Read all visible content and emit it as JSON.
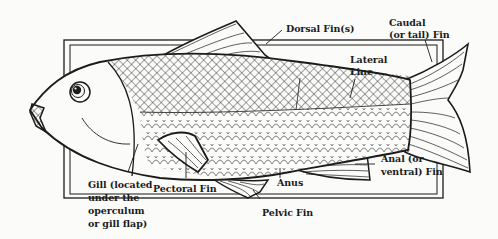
{
  "figure": {
    "type": "labeled anatomical diagram",
    "colors": {
      "ink": "#1b1b1b",
      "paper": "#fbfbf9",
      "bleed_through_text": "#dcdcdc"
    }
  },
  "labels": {
    "dorsal_fin": "Dorsal Fin(s)",
    "caudal_fin_line1": "Caudal",
    "caudal_fin_line2": "(or tail) Fin",
    "lateral_line_line1": "Lateral",
    "lateral_line_line2": "Line",
    "gill_line1": "Gill (located",
    "gill_line2": "under the",
    "gill_line3": "operculum",
    "gill_line4": "or gill flap)",
    "pectoral_fin": "Pectoral Fin",
    "anus": "Anus",
    "pelvic_fin": "Pelvic Fin",
    "anal_fin_line1": "Anal (or",
    "anal_fin_line2": "ventral) Fin"
  }
}
